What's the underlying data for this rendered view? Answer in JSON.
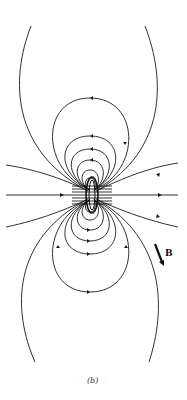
{
  "figure": {
    "caption": "(b)",
    "vector_label": "B",
    "colors": {
      "line": "#1a1a1a",
      "background": "#ffffff"
    }
  }
}
